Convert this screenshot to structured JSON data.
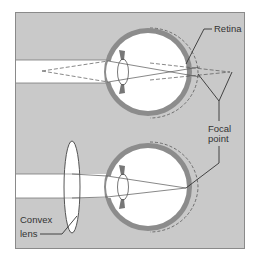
{
  "figure": {
    "type": "optics-diagram",
    "colors": {
      "frame_bg": "#c9c9c9",
      "frame_border": "#8a8a8a",
      "sclera": "#8c8c8c",
      "eye_interior": "#ffffff",
      "light_beam": "#ffffff",
      "line": "#4a4a4a",
      "text": "#333333"
    },
    "panels": [
      {
        "name": "uncorrected-eye",
        "description": "Rays focus behind the retina"
      },
      {
        "name": "corrected-eye",
        "description": "Convex lens brings focus onto the retina"
      }
    ],
    "labels": {
      "retina": "Retina",
      "focal_line1": "Focal",
      "focal_line2": "point",
      "convex_line1": "Convex",
      "convex_line2": "lens"
    }
  }
}
